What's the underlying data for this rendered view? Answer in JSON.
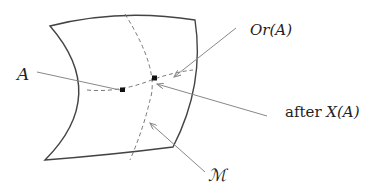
{
  "diagram": {
    "labels": {
      "point_a": "A",
      "orientation": "Or(A)",
      "after_x_prefix": "after ",
      "after_x_expr": "X(A)",
      "manifold": "ℳ"
    },
    "colors": {
      "surface_stroke": "#444444",
      "dashed_curve": "#777777",
      "leader_line": "#888888",
      "marker": "#111111",
      "text": "#222222"
    }
  }
}
